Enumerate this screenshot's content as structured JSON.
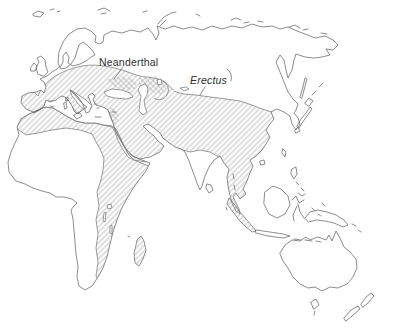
{
  "figure": {
    "type": "species-range-map",
    "background": "#ffffff"
  },
  "labels": {
    "neanderthal": "Neanderthal",
    "erectus": "Erectus"
  },
  "colors": {
    "coastline": "#6f6f6f",
    "boundary": "#7a7a7a",
    "hatch": "#8f8f8f",
    "label_text": "#2e2e2e"
  },
  "regions": [
    {
      "id": "neanderthal-range",
      "label": "Neanderthal",
      "pattern": "diagonal-hatch",
      "area": "Europe, Near East, Caspian region"
    },
    {
      "id": "erectus-range",
      "label": "Erectus",
      "pattern": "diagonal-hatch",
      "area": "North and East Africa, Arabia, South and East Asia, Sumatra, Madagascar"
    },
    {
      "id": "range-overlap",
      "pattern": "cross-hatch",
      "area": "Pontic-Caspian and Levant patches"
    }
  ]
}
